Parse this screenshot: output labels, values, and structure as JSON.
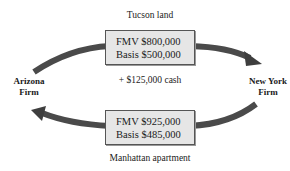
{
  "diagram": {
    "top_label": "Tucson land",
    "top_box": {
      "line1": "FMV $800,000",
      "line2": "Basis $500,000"
    },
    "cash_label": "+ $125,000 cash",
    "bottom_box": {
      "line1": "FMV $925,000",
      "line2": "Basis $485,000"
    },
    "bottom_label": "Manhattan apartment",
    "left_party": {
      "line1": "Arizona",
      "line2": "Firm"
    },
    "right_party": {
      "line1": "New York",
      "line2": "Firm"
    },
    "arrows": [
      {
        "from": "Arizona Firm",
        "to": "New York Firm",
        "carries": "Tucson land + $125,000 cash"
      },
      {
        "from": "New York Firm",
        "to": "Arizona Firm",
        "carries": "Manhattan apartment"
      }
    ],
    "colors": {
      "arrow": "#4a4a4a",
      "box_fill": "#e6e6e6",
      "box_border": "#555555"
    }
  }
}
